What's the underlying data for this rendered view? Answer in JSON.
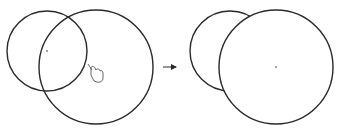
{
  "diagram": {
    "stroke_color": "#2a2a2a",
    "center_dot_color": "#777777",
    "before": {
      "small_circle": {
        "cx": 47,
        "cy": 51,
        "r": 40
      },
      "large_circle": {
        "cx": 96,
        "cy": 67,
        "r": 57
      },
      "cursor": {
        "icon": "hand-pointer-icon",
        "x": 88,
        "y": 64
      }
    },
    "arrow": {
      "x1": 163,
      "y1": 67,
      "x2": 176,
      "y2": 67
    },
    "after": {
      "small_circle": {
        "cx": 230,
        "cy": 51,
        "r": 40
      },
      "large_circle": {
        "cx": 276,
        "cy": 67,
        "r": 57
      }
    }
  }
}
